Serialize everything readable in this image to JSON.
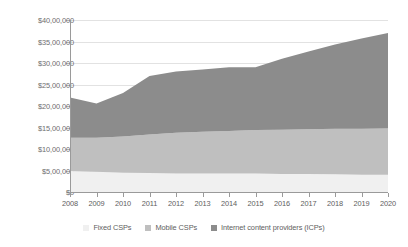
{
  "chart_data": {
    "type": "area",
    "title": "",
    "xlabel": "",
    "ylabel": "",
    "stacked": true,
    "grid": true,
    "legend_position": "bottom",
    "categories": [
      "2008",
      "2009",
      "2010",
      "2011",
      "2012",
      "2013",
      "2014",
      "2015",
      "2016",
      "2017",
      "2018",
      "2019",
      "2020"
    ],
    "x": [
      2008,
      2009,
      2010,
      2011,
      2012,
      2013,
      2014,
      2015,
      2016,
      2017,
      2018,
      2019,
      2020
    ],
    "ylim": [
      0,
      4000000
    ],
    "y_ticks": [
      0,
      500000,
      1000000,
      1500000,
      2000000,
      2500000,
      3000000,
      3500000,
      4000000
    ],
    "y_tick_labels": [
      "$0",
      "$5,00,000",
      "$10,00,000",
      "$15,00,000",
      "$20,00,000",
      "$25,00,000",
      "$30,00,000",
      "$35,00,000",
      "$40,00,000"
    ],
    "series": [
      {
        "name": "Fixed CSPs",
        "color": "#f0f0f0",
        "values": [
          490000,
          470000,
          450000,
          440000,
          430000,
          430000,
          430000,
          430000,
          420000,
          420000,
          410000,
          400000,
          400000
        ]
      },
      {
        "name": "Mobile CSPs",
        "color": "#bfbfbf",
        "values": [
          770000,
          790000,
          840000,
          900000,
          950000,
          970000,
          990000,
          1010000,
          1030000,
          1040000,
          1060000,
          1070000,
          1080000
        ]
      },
      {
        "name": "Internet content providers (ICPs)",
        "color": "#8c8c8c",
        "values": [
          940000,
          800000,
          1010000,
          1360000,
          1420000,
          1450000,
          1480000,
          1460000,
          1650000,
          1810000,
          1960000,
          2100000,
          2220000
        ]
      }
    ],
    "totals": [
      2200000,
      2060000,
      2300000,
      2700000,
      2800000,
      2850000,
      2900000,
      2900000,
      3100000,
      3270000,
      3430000,
      3570000,
      3700000
    ]
  },
  "legend": {
    "items": [
      {
        "label": "Fixed CSPs",
        "color": "#f0f0f0"
      },
      {
        "label": "Mobile CSPs",
        "color": "#bfbfbf"
      },
      {
        "label": "Internet content providers (ICPs)",
        "color": "#8c8c8c"
      }
    ]
  }
}
